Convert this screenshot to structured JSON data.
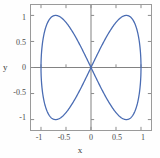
{
  "chart_data": {
    "type": "line",
    "title": "",
    "subtitle": "",
    "xlabel": "x",
    "ylabel": "y",
    "xlim": [
      -1.2,
      1.2
    ],
    "ylim": [
      -1.2,
      1.2
    ],
    "grid": false,
    "legend": null,
    "curve_color": "#4a6cb3",
    "axis_color": "#808080",
    "frame_color": "#9a9a9a",
    "parametric": {
      "x_expr": "sin(t)",
      "y_expr": "sin(2t)",
      "t_range": [
        0,
        6.283185307179586
      ]
    },
    "series": [
      {
        "name": "figure-eight",
        "x": [
          0,
          0.156,
          0.309,
          0.454,
          0.588,
          0.707,
          0.809,
          0.891,
          0.951,
          0.988,
          1.0,
          0.988,
          0.951,
          0.891,
          0.809,
          0.707,
          0.588,
          0.454,
          0.309,
          0.156,
          0,
          -0.156,
          -0.309,
          -0.454,
          -0.588,
          -0.707,
          -0.809,
          -0.891,
          -0.951,
          -0.988,
          -1.0,
          -0.988,
          -0.951,
          -0.891,
          -0.809,
          -0.707,
          -0.588,
          -0.454,
          -0.309,
          -0.156,
          0
        ],
        "y": [
          0,
          0.309,
          0.588,
          0.809,
          0.951,
          1.0,
          0.951,
          0.809,
          0.588,
          0.309,
          0,
          -0.309,
          -0.588,
          -0.809,
          -0.951,
          -1.0,
          -0.951,
          -0.809,
          -0.588,
          -0.309,
          0,
          0.309,
          0.588,
          0.809,
          0.951,
          1.0,
          0.951,
          0.809,
          0.588,
          0.309,
          0,
          -0.309,
          -0.588,
          -0.809,
          -0.951,
          -1.0,
          -0.951,
          -0.809,
          -0.588,
          -0.309,
          0
        ]
      }
    ],
    "x_ticks": [
      {
        "value": -1,
        "label": "-1"
      },
      {
        "value": -0.5,
        "label": "-0.5"
      },
      {
        "value": 0,
        "label": "0"
      },
      {
        "value": 0.5,
        "label": "0.5"
      },
      {
        "value": 1,
        "label": "1"
      }
    ],
    "y_ticks": [
      {
        "value": 1,
        "label": "1"
      },
      {
        "value": 0.5,
        "label": "0.5"
      },
      {
        "value": 0,
        "label": "0"
      },
      {
        "value": -0.5,
        "label": "-0.5"
      },
      {
        "value": -1,
        "label": "-1"
      }
    ]
  }
}
